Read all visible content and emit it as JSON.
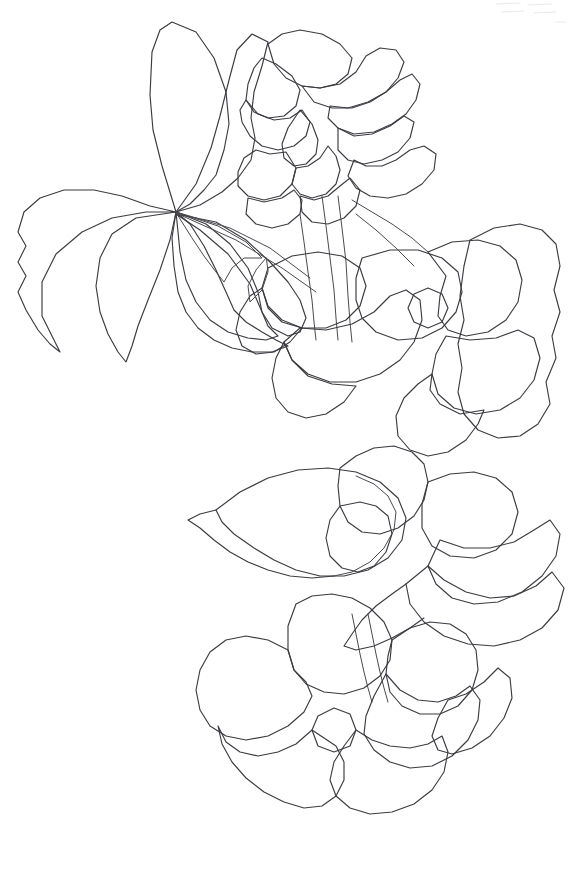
{
  "artwork": {
    "title": "Hydrangea branch line drawing",
    "medium": "pencil contour line art",
    "subject": "flowering branch with leaves and two blossom clusters",
    "background_color": "#ffffff",
    "line_color": "#3b3b41",
    "canvas": {
      "width": 581,
      "height": 873
    },
    "description": "Uncolored coloring-book style botanical outline: a large palmate leaf upper-left, a small flower cluster upper-right, a dense mass of overlapping petals and leaves through the middle, and a five-petal blossom at the bottom center."
  },
  "shapes": {
    "leaf_upper_left_lobe": "M176,212 L162,166 L153,130 L150,95 L152,52 L160,30 L172,22 L196,32 L214,58 L226,92 L229,124 L224,150 L216,175 L204,190 L190,204 Z",
    "leaf_upper_mid_lobe": "M176,212 L196,184 L211,148 L220,116 L229,80 L237,50 L252,34 L268,42 L262,66 L254,92 L251,118 L255,138 L251,160 L238,178 L222,192 L200,205 Z",
    "leaf_left_lobe": "M176,212 L150,206 L122,196 L94,190 L64,190 L40,198 L24,212 L18,232 L26,246 L18,262 L26,276 L18,292 L26,310 L38,330 L50,344 L60,352 L42,316 L42,282 L56,254 L82,232 L112,218 L146,212 Z",
    "leaf_lower_left_lobe": "M176,212 L170,240 L160,270 L148,300 L138,326 L132,346 L126,362 L118,352 L108,334 L100,312 L96,286 L100,258 L112,234 L136,218 Z",
    "leaf_lower_center": "M176,212 L190,224 L204,246 L216,270 L226,292 L234,310 L246,322 L262,332 L276,340 L288,346 L272,352 L252,352 L232,348 L214,340 L198,328 L186,312 L178,292 L174,266 L172,238 Z",
    "leaf_big_center_lower": "M176,212 L206,224 L230,244 L248,268 L258,292 L262,312 L268,326 L278,336 L266,340 L248,338 L228,332 L210,320 L196,302 L186,280 L180,252 Z",
    "leaf_vein_sprig_a": "M176,212 L218,226 L246,242 L262,258 L244,258 L232,268 L224,282 L216,272 L204,256 L192,238 Z",
    "leaf_vein_sprig_b": "M176,212 L230,228 L270,248 L294,266 L310,278",
    "leaf_vein_sprig_c": "M178,214 L236,240 L282,268 L316,292",
    "leaf_main_blade_right": "M176,214 L200,230 L228,254 L250,284 L262,312 L272,328 L288,336 L300,332 L306,318 L300,300 L288,282 L270,262 L246,240 L216,222 Z",
    "cluster_top_petal_a": "M268,44 L282,34 L300,30 L322,34 L340,44 L352,58 L348,74 L336,84 L320,88 L302,86 L286,78 L274,64 Z",
    "cluster_top_petal_b": "M302,86 L320,88 L340,84 L356,72 L366,56 L380,48 L396,50 L404,62 L398,78 L386,92 L370,102 L352,108 L332,108 L314,102 Z",
    "cluster_top_petal_c": "M262,58 L276,64 L292,76 L300,90 L296,106 L284,116 L268,118 L254,112 L246,100 L248,84 L254,68 Z",
    "cluster_top_petal_d": "M330,106 L348,108 L368,102 L386,92 L400,80 L412,74 L420,84 L416,100 L406,114 L392,124 L374,132 L354,134 L338,128 L328,118 Z",
    "cluster_top_petal_e": "M246,100 L258,114 L274,120 L290,118 L302,110 L310,122 L306,136 L294,146 L278,150 L262,146 L250,136 L242,122 L240,110 Z",
    "cluster_top_petal_f": "M300,110 L312,124 L318,140 L316,154 L306,164 L294,166 L284,158 L282,144 L288,128 Z",
    "cluster_top_petal_g": "M338,128 L354,136 L372,134 L390,126 L404,116 L414,122 L410,138 L398,152 L382,160 L364,164 L348,160 L338,150 Z",
    "cluster_top_petal_h": "M354,160 L366,166 L382,166 L396,160 L410,150 L424,146 L436,154 L434,170 L422,184 L406,194 L388,198 L370,196 L356,188 L348,176 Z",
    "cluster_top_petal_i": "M296,168 L308,166 L320,158 L328,146 L336,156 L340,170 L336,184 L326,194 L312,198 L300,194 L292,184 Z",
    "cluster_top_petal_j": "M256,150 L270,154 L286,152 L296,168 L292,184 L280,196 L264,200 L248,196 L238,186 L238,172 L244,158 Z",
    "cluster_top_petal_k": "M248,198 L264,202 L282,198 L294,190 L302,200 L300,214 L288,224 L272,228 L256,224 L246,214 Z",
    "cluster_top_sepal": "M300,196 L314,200 L328,196 L340,186 L350,178 L360,190 L356,206 L344,218 L328,224 L312,222 L302,212 Z",
    "stem_upper_left": "M322,196 L326,226 L330,258 L334,290 L336,318 L338,340",
    "stem_upper_right": "M338,196 L342,228 L346,262 L348,296 L350,322 L352,342",
    "stem_join_left": "M300,214 L304,242 L308,272 L312,300 L314,322 L316,340",
    "stem_branch_out": "M352,200 L372,212 L392,224 L412,238 L428,252",
    "stem_branch_out_2": "M356,214 L376,230 L396,248 L414,266",
    "petal_mid_a": "M268,268 L292,256 L318,252 L342,256 L360,268 L366,286 L360,306 L346,320 L326,328 L302,328 L282,320 L268,306 L262,288 Z",
    "petal_mid_b": "M262,288 L250,296 L240,312 L236,330 L242,346 L256,354 L274,352 L290,342 L302,328 L282,322 L268,308 Z",
    "petal_mid_c": "M266,258 L256,270 L248,286 L250,302 L262,290 L268,272 Z",
    "petal_big_center": "M300,328 L326,330 L352,324 L374,312 L390,296 L406,290 L420,300 L422,320 L414,342 L400,360 L380,374 L356,382 L330,382 L308,374 L292,360 L284,342 Z",
    "petal_big_center_lower": "M284,342 L276,358 L272,378 L276,398 L288,412 L306,418 L326,414 L344,402 L356,386 L332,384 L308,376 L292,360 Z",
    "petal_right_upper_a": "M362,258 L390,250 L418,250 L442,258 L458,272 L462,292 L456,312 L442,328 L422,338 L398,340 L376,332 L362,318 L356,300 L356,278 Z",
    "petal_right_upper_b": "M428,252 L452,242 L478,240 L500,246 L516,260 L522,280 L518,302 L506,320 L488,332 L466,336 L448,330 L438,316 L440,296 L446,276 Z",
    "petal_far_right": "M470,240 L494,228 L520,224 L542,230 L556,244 L560,266 L554,290 L560,312 L552,336 L556,358 L546,382 L550,404 L538,424 L520,436 L498,438 L478,430 L464,414 L458,392 L462,368 L458,344 L464,320 L460,296 L464,266 Z",
    "petal_right_mid": "M446,336 L470,340 L496,338 L518,330 L534,338 L540,358 L534,380 L520,398 L500,410 L476,414 L454,408 L438,394 L432,374 L436,354 Z",
    "petal_right_lower": "M432,374 L418,384 L404,398 L396,416 L398,436 L410,450 L428,456 L448,452 L466,440 L478,424 L484,410 L460,414 L440,404 L430,390 Z",
    "petal_center_knot": "M414,294 L428,288 L442,294 L448,308 L442,322 L428,328 L414,322 L408,308 Z",
    "leaf_sweep_big_left": "M216,510 L240,492 L268,478 L298,470 L328,468 L356,472 L380,482 L398,498 L406,518 L402,540 L388,558 L368,570 L344,576 L320,576 L296,570 L274,560 L254,548 L234,534 L222,522 Z",
    "leaf_sweep_left_tail": "M216,510 L200,514 L188,520 L200,528 L214,540 L230,552 L248,562 L268,570 L290,576 L312,578 L334,576",
    "leaf_sweep_under": "M334,576 L352,572 L370,562 L384,548 L394,530 L396,512 L388,496 L374,484 L356,476",
    "petal_mid_low_a": "M340,468 L356,456 L374,448 L394,446 L412,452 L424,464 L428,482 L424,500 L414,516 L398,528 L380,534 L362,532 L348,522 L340,506 L338,486 Z",
    "petal_mid_low_b": "M340,506 L330,520 L326,538 L330,556 L342,568 L358,572 L374,566 L386,552 L392,534 L388,516 L376,506 L360,502 Z",
    "petal_low_right_a": "M428,482 L450,474 L474,472 L496,478 L512,492 L518,512 L512,534 L496,550 L474,558 L450,556 L432,546 L422,528 L422,504 Z",
    "petal_low_right_b": "M440,540 L464,548 L490,548 L514,542 L534,530 L550,520 L560,534 L556,556 L542,576 L522,592 L498,602 L474,604 L452,598 L436,584 L428,566 Z",
    "leaf_bottom_right_sweep": "M428,566 L444,580 L466,592 L490,598 L514,596 L536,586 L552,572 L564,588 L558,610 L542,628 L520,640 L494,646 L468,644 L444,636 L424,622 L410,604 L406,584 Z",
    "leaf_bottom_right_tip": "M406,584 L392,594 L376,606 L362,620 L352,634 L344,646 L356,650 L374,646 L392,638 L410,628 L424,618",
    "blossom_lower_stem_a": "M352,614 L356,634 L360,654 L364,672 L368,688 L372,702",
    "blossom_lower_stem_b": "M368,614 L372,634 L376,654 L380,672 L384,688 L388,702",
    "blossom_lower_petal_top": "M296,604 L312,596 L332,594 L352,598 L370,608 L384,622 L392,640 L390,660 L380,676 L364,688 L344,694 L324,692 L306,684 L294,670 L288,650 L288,626 Z",
    "blossom_lower_petal_left": "M288,650 L268,640 L246,636 L226,640 L210,652 L200,670 L196,690 L200,710 L210,726 L226,736 L246,740 L268,736 L288,726 L304,712 L312,696 L306,682 L294,670 Z",
    "blossom_lower_petal_right_top": "M392,640 L410,628 L430,622 L450,624 L466,634 L476,650 L478,670 L472,690 L458,706 L440,714 L420,714 L402,706 L390,692 L386,674 L388,656 Z",
    "blossom_lower_center_knot": "M318,716 L334,708 L350,714 L356,730 L350,746 L334,752 L318,746 L312,730 Z",
    "blossom_lower_petal_bottom_left": "M312,730 L296,744 L278,752 L258,756 L240,752 L226,742 L218,726 L222,744 L232,762 L246,778 L264,792 L284,802 L304,808 L322,806 L336,796 L344,780 L344,762 L336,746 Z",
    "blossom_lower_petal_bottom_right": "M356,730 L372,740 L390,746 L410,748 L428,744 L442,736 L448,752 L444,772 L432,790 L414,804 L392,812 L370,814 L350,808 L336,796 L330,780 L334,762 L344,746 Z",
    "blossom_lower_petal_right_low": "M386,674 L400,690 L418,700 L438,702 L456,696 L470,686 L480,700 L478,720 L468,740 L452,756 L432,766 L410,768 L390,762 L374,750 L364,734 L366,716 L374,696 Z",
    "blossom_lower_petal_far_right": "M448,700 L466,694 L484,682 L498,668 L510,678 L512,698 L504,718 L490,736 L472,748 L452,754 L438,750 L432,736 L438,718 Z"
  },
  "specks": [
    {
      "id": "scan-speck-1",
      "d": "M496,4 L520,3"
    },
    {
      "id": "scan-speck-2",
      "d": "M528,5 L552,4"
    },
    {
      "id": "scan-speck-3",
      "d": "M502,12 L524,11"
    },
    {
      "id": "scan-speck-4",
      "d": "M534,13 L556,12"
    },
    {
      "id": "scan-speck-5",
      "d": "M556,22 L566,22"
    }
  ]
}
